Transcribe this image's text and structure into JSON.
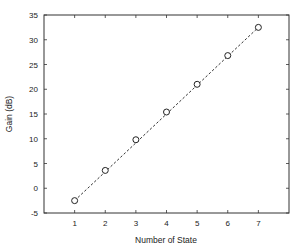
{
  "chart_data": {
    "type": "scatter",
    "title": "",
    "xlabel": "Number of State",
    "ylabel": "Gain (dB)",
    "x": [
      1,
      2,
      3,
      4,
      5,
      6,
      7
    ],
    "series": [
      {
        "name": "measured",
        "marker": "open-circle",
        "values": [
          -2.5,
          3.6,
          9.8,
          15.4,
          21.0,
          26.8,
          32.5
        ]
      },
      {
        "name": "linear fit",
        "style": "dashed-line",
        "values": [
          -2.5,
          3.33,
          9.17,
          15.0,
          20.83,
          26.67,
          32.5
        ]
      }
    ],
    "xlim": [
      0,
      8
    ],
    "ylim": [
      -5,
      35
    ],
    "xticks": [
      1,
      2,
      3,
      4,
      5,
      6,
      7
    ],
    "yticks": [
      -5,
      0,
      5,
      10,
      15,
      20,
      25,
      30,
      35
    ],
    "grid": false,
    "legend": null
  },
  "colors": {
    "axis": "#333333",
    "marker": "#222222",
    "line": "#333333",
    "background": "#ffffff"
  }
}
